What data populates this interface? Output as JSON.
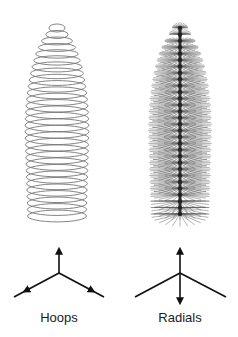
{
  "panels": [
    {
      "id": "hoops",
      "label": "Hoops",
      "shape": {
        "cx": 57,
        "top": 22,
        "bottom": 222,
        "max_half_width": 32,
        "count": 30,
        "ellipse_ry_ratio": 0.2,
        "stroke": "#777777"
      },
      "axis": {
        "cx": 59,
        "cy": 273,
        "up": [
          59,
          250
        ],
        "left": [
          14,
          297
        ],
        "right": [
          104,
          297
        ],
        "arrows": [
          "up",
          "left",
          "right"
        ]
      },
      "label_x": 59
    },
    {
      "id": "radials",
      "label": "Radials",
      "shape": {
        "cx": 180,
        "top": 22,
        "bottom": 222,
        "max_half_width": 32,
        "count": 30,
        "spokes": 24,
        "stroke": "#555555"
      },
      "axis": {
        "cx": 180,
        "cy": 273,
        "up": [
          180,
          250
        ],
        "down": [
          180,
          302
        ],
        "left": [
          135,
          297
        ],
        "right": [
          226,
          297
        ],
        "arrows": [
          "up",
          "down"
        ]
      },
      "label_x": 180
    }
  ],
  "colors": {
    "background": "#ffffff",
    "axis": "#111111",
    "text": "#1a1a1a"
  }
}
